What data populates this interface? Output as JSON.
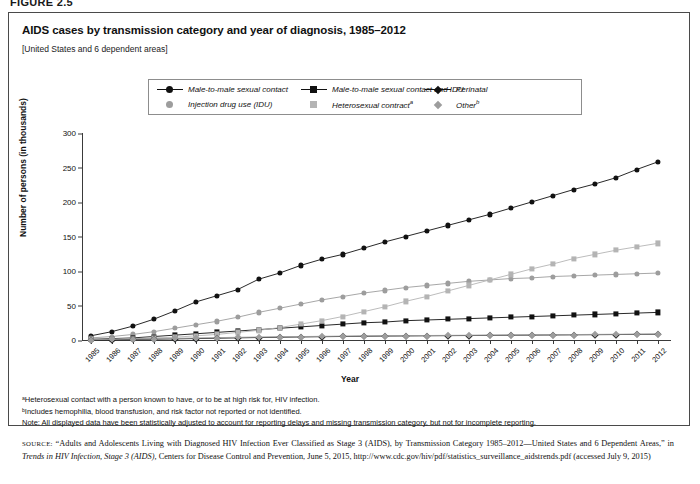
{
  "figure": {
    "number": "FIGURE 2.5"
  },
  "header": {
    "title": "AIDS cases by transmission category and year of diagnosis, 1985–2012",
    "subtitle": "[United States and 6 dependent areas]"
  },
  "notes": {
    "a": "ᵃHeterosexual contact with a person known to have, or to be at high risk for, HIV infection.",
    "b": "ᵇIncludes hemophilia, blood transfusion, and risk factor not reported or not identified.",
    "note": "Note: All displayed data have been statistically adjusted to account for reporting delays and missing transmission category, but not for incomplete reporting."
  },
  "source": {
    "label": "SOURCE:",
    "text_1": "“Adults and Adolescents Living with Diagnosed HIV Infection Ever Classified as Stage 3 (AIDS), by Transmission Category 1985–2012—United States and 6 Dependent Areas,” in ",
    "italic": "Trends in HIV Infection, Stage 3 (AIDS),",
    "text_2": " Centers for Disease Control and Prevention, June 5, 2015, http://www.cdc.gov/hiv/pdf/statistics_surveillance_aidstrends.pdf (accessed July 9, 2015)"
  },
  "chart_data": {
    "type": "line",
    "title": "AIDS cases by transmission category and year of diagnosis, 1985–2012",
    "xlabel": "Year",
    "ylabel": "Number of persons (in thousands)",
    "ylim": [
      0,
      300
    ],
    "yticks": [
      0,
      50,
      100,
      150,
      200,
      250,
      300
    ],
    "grid": false,
    "legend_position": "top",
    "categories": [
      "1985",
      "1986",
      "1987",
      "1988",
      "1989",
      "1990",
      "1991",
      "1992",
      "1993",
      "1994",
      "1995",
      "1996",
      "1997",
      "1998",
      "1999",
      "2000",
      "2001",
      "2002",
      "2003",
      "2004",
      "2005",
      "2006",
      "2007",
      "2008",
      "2009",
      "2010",
      "2011",
      "2012"
    ],
    "series": [
      {
        "name": "Male-to-male sexual contact",
        "marker": "circle",
        "color": "#111111",
        "values": [
          6,
          12,
          20,
          30,
          42,
          55,
          64,
          73,
          88,
          97,
          108,
          117,
          124,
          133,
          142,
          150,
          158,
          166,
          174,
          182,
          191,
          200,
          209,
          218,
          226,
          235,
          247,
          258
        ]
      },
      {
        "name": "Injection drug use (IDU)",
        "marker": "circle",
        "color": "#9d9d9d",
        "values": [
          3,
          5,
          8,
          12,
          17,
          22,
          27,
          33,
          40,
          46,
          52,
          58,
          63,
          68,
          72,
          76,
          79,
          82,
          85,
          87,
          89,
          90,
          92,
          93,
          94,
          95,
          96,
          97
        ]
      },
      {
        "name": "Male-to-male sexual contact and IDU",
        "marker": "square",
        "color": "#111111",
        "values": [
          1,
          2,
          3,
          5,
          7,
          9,
          11,
          13,
          15,
          17,
          19,
          21,
          23,
          25,
          26,
          28,
          29,
          30,
          31,
          32,
          33,
          34,
          35,
          36,
          37,
          38,
          39,
          40
        ]
      },
      {
        "name": "Heterosexual contractᵃ",
        "marker": "square",
        "color": "#b4b4b4",
        "values": [
          1,
          1,
          2,
          3,
          4,
          6,
          8,
          11,
          14,
          18,
          23,
          28,
          34,
          41,
          48,
          56,
          63,
          71,
          79,
          87,
          95,
          103,
          110,
          118,
          124,
          130,
          135,
          140
        ]
      },
      {
        "name": "Perinatal",
        "marker": "diamond",
        "color": "#111111",
        "values": [
          0.3,
          0.5,
          0.8,
          1.2,
          1.6,
          2.1,
          2.6,
          3.1,
          3.6,
          4.0,
          4.4,
          4.8,
          5.1,
          5.4,
          5.7,
          5.9,
          6.1,
          6.3,
          6.5,
          6.7,
          6.9,
          7.1,
          7.3,
          7.5,
          7.7,
          7.9,
          8.1,
          8.3
        ]
      },
      {
        "name": "Otherᵇ",
        "marker": "diamond",
        "color": "#9d9d9d",
        "values": [
          0.5,
          0.9,
          1.4,
          1.9,
          2.4,
          2.9,
          3.4,
          3.9,
          4.3,
          4.7,
          5.0,
          5.3,
          5.6,
          5.9,
          6.1,
          6.3,
          6.5,
          6.7,
          6.9,
          7.1,
          7.3,
          7.5,
          7.7,
          7.9,
          8.1,
          8.3,
          8.5,
          8.7
        ]
      }
    ]
  },
  "legend": {
    "entries": [
      {
        "label": "Male-to-male sexual contact",
        "marker": "circle",
        "color": "#111111",
        "line": true,
        "sup": ""
      },
      {
        "label": "Injection drug use (IDU)",
        "marker": "circle",
        "color": "#9d9d9d",
        "line": false,
        "sup": ""
      },
      {
        "label": "Male-to-male sexual contact and IDU",
        "marker": "square",
        "color": "#111111",
        "line": true,
        "sup": ""
      },
      {
        "label": "Heterosexual contract",
        "marker": "square",
        "color": "#b4b4b4",
        "line": false,
        "sup": "a"
      },
      {
        "label": "Perinatal",
        "marker": "diamond",
        "color": "#111111",
        "line": true,
        "sup": ""
      },
      {
        "label": "Other",
        "marker": "diamond",
        "color": "#9d9d9d",
        "line": false,
        "sup": "b"
      }
    ]
  }
}
